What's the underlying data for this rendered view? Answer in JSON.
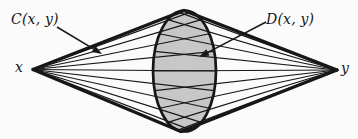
{
  "diagram": {
    "background": "#fbfbfb",
    "ink": "#171717",
    "ellipse": {
      "cx": 184.5,
      "cy": 71,
      "rx": 31.5,
      "ry": 60.5,
      "fill": "#c7c7c7",
      "stroke_width": 2.7
    },
    "vertex_left": {
      "x": 33,
      "y": 69.5,
      "label": "x"
    },
    "vertex_right": {
      "x": 337,
      "y": 70,
      "label": "y"
    },
    "outline": {
      "stroke_width": 3.3,
      "top_bend_x": 184,
      "top_bend_y": 10.5,
      "bottom_bend_x": 181,
      "bottom_bend_y": 131.5
    },
    "rays": {
      "stroke_width": 1.25,
      "angles_deg": [
        -78,
        -58,
        -38,
        -19,
        0,
        19,
        38,
        58,
        78
      ]
    },
    "labels": {
      "C": "C(x, y)",
      "D": "D(x, y)"
    },
    "annotations": {
      "arrow_stroke_width": 1.5,
      "C_arrow": {
        "x1": 57,
        "y1": 27,
        "x2": 102,
        "y2": 54
      },
      "D_arrow": {
        "x1": 266,
        "y1": 22,
        "x2": 199,
        "y2": 57
      }
    }
  }
}
